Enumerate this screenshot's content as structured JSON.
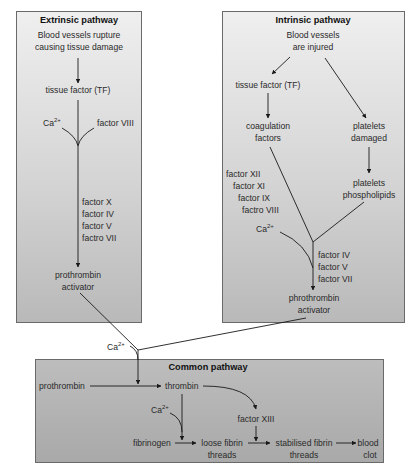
{
  "extrinsic": {
    "title": "Extrinsic pathway",
    "start_line1": "Blood vessels rupture",
    "start_line2": "causing tissue damage",
    "tissue_factor": "tissue factor (TF)",
    "ca_label": "Ca",
    "ca_sup": "2+",
    "factor_viii": "factor VIII",
    "factors": [
      "factor X",
      "factor IV",
      "factor V",
      "factro VII"
    ],
    "end_line1": "prothrombin",
    "end_line2": "activator"
  },
  "intrinsic": {
    "title": "Intrinsic pathway",
    "start_line1": "Blood vessels",
    "start_line2": "are injured",
    "tissue_factor": "tissue factor (TF)",
    "coag_line1": "coagulation",
    "coag_line2": "factors",
    "plat_dmg_line1": "platelets",
    "plat_dmg_line2": "damaged",
    "plat_phos_line1": "platelets",
    "plat_phos_line2": "phospholipids",
    "factors_left": [
      "factor XII",
      "factor XI",
      "factor IX",
      "factro VIII"
    ],
    "ca_label": "Ca",
    "ca_sup": "2+",
    "factors_right": [
      "factor IV",
      "factor V",
      "factor VII"
    ],
    "end_line1": "phrothrombin",
    "end_line2": "activator"
  },
  "junction": {
    "ca_label": "Ca",
    "ca_sup": "2+"
  },
  "common": {
    "title": "Common pathway",
    "prothrombin": "prothrombin",
    "thrombin": "thrombin",
    "ca_label": "Ca",
    "ca_sup": "2+",
    "factor_xiii": "factor XIII",
    "fibrinogen": "fibrinogen",
    "loose_line1": "loose fibrin",
    "loose_line2": "threads",
    "stab_line1": "stabilised fibrin",
    "stab_line2": "threads",
    "clot_line1": "blood",
    "clot_line2": "clot"
  },
  "colors": {
    "box_light": "#efefef",
    "box_dark": "#b9b9b9",
    "common_box": "#b0b0b0",
    "line": "#1a1a1a",
    "border": "#6a6a6a"
  }
}
